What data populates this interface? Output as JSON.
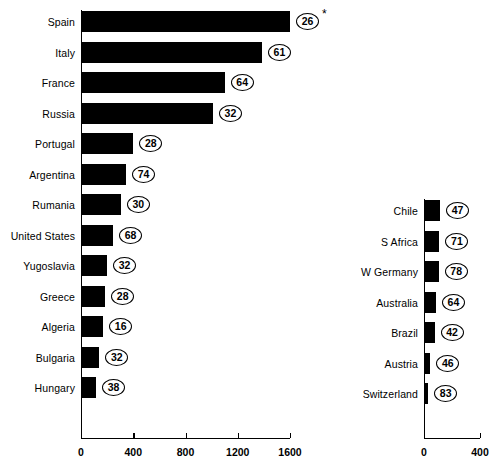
{
  "chart_data": {
    "type": "bar",
    "title": "",
    "xlabel": "",
    "ylabel": "",
    "orientation": "horizontal",
    "grid": false,
    "legend": null,
    "panels": [
      {
        "name": "left-panel",
        "xlim": [
          0,
          1600
        ],
        "xticks": [
          0,
          400,
          800,
          1200,
          1600
        ],
        "xtick_labels": [
          "0",
          "400",
          "800",
          "1200",
          "1600"
        ],
        "categories": [
          "Spain",
          "Italy",
          "France",
          "Russia",
          "Portugal",
          "Argentina",
          "Rumania",
          "United States",
          "Yugoslavia",
          "Greece",
          "Algeria",
          "Bulgaria",
          "Hungary"
        ],
        "values": [
          1600,
          1385,
          1100,
          1010,
          400,
          345,
          305,
          245,
          200,
          185,
          170,
          140,
          115
        ],
        "annotations": [
          "26",
          "61",
          "64",
          "32",
          "28",
          "74",
          "30",
          "68",
          "32",
          "28",
          "16",
          "32",
          "38"
        ],
        "note_marker": "*",
        "note_marker_on": "Spain"
      },
      {
        "name": "right-panel",
        "xlim": [
          0,
          400
        ],
        "xticks": [
          0,
          400
        ],
        "xtick_labels": [
          "0",
          "400"
        ],
        "categories": [
          "Chile",
          "S Africa",
          "W Germany",
          "Australia",
          "Brazil",
          "Austria",
          "Switzerland"
        ],
        "values": [
          115,
          110,
          105,
          85,
          75,
          45,
          30
        ],
        "annotations": [
          "47",
          "71",
          "78",
          "64",
          "42",
          "46",
          "83"
        ]
      }
    ]
  },
  "caption": ""
}
